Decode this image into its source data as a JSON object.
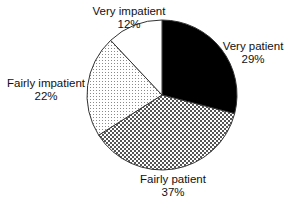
{
  "chart_data": {
    "type": "pie",
    "title": "",
    "center": [
      162,
      95
    ],
    "radius": 75,
    "start_angle_deg": 0,
    "direction": "clockwise",
    "slices": [
      {
        "label": "Very patient",
        "value": 29,
        "display": "29%",
        "fill": "black",
        "color": "#000000"
      },
      {
        "label": "Fairly patient",
        "value": 37,
        "display": "37%",
        "fill": "crosshatch",
        "color": "#888888"
      },
      {
        "label": "Fairly impatient",
        "value": 22,
        "display": "22%",
        "fill": "dots",
        "color": "#d8d8d8"
      },
      {
        "label": "Very impatient",
        "value": 12,
        "display": "12%",
        "fill": "white",
        "color": "#ffffff"
      }
    ],
    "legend": "none (labels placed outside slices)"
  },
  "labels": {
    "very_patient": {
      "name": "Very patient",
      "pct": "29%"
    },
    "fairly_patient": {
      "name": "Fairly patient",
      "pct": "37%"
    },
    "fairly_impatient": {
      "name": "Fairly impatient",
      "pct": "22%"
    },
    "very_impatient": {
      "name": "Very impatient",
      "pct": "12%"
    }
  }
}
